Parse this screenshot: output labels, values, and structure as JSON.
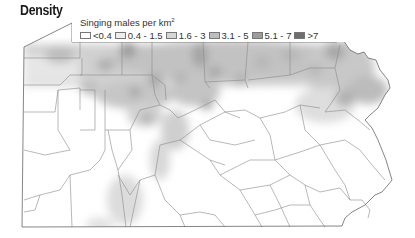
{
  "title": "Density",
  "legend": {
    "title": "Singing males per km",
    "title_superscript": "2",
    "classes": [
      {
        "label": "<0.4",
        "color": "#ffffff"
      },
      {
        "label": "0.4 - 1.5",
        "color": "#ededed"
      },
      {
        "label": "1.6 - 3",
        "color": "#d6d6d6"
      },
      {
        "label": "3.1 - 5",
        "color": "#bdbdbd"
      },
      {
        "label": "5.1 - 7",
        "color": "#9c9c9c"
      },
      {
        "label": ">7",
        "color": "#6e6e6e"
      }
    ]
  },
  "map": {
    "region": "Pennsylvania",
    "boundary_color": "#666666",
    "county_line_color": "#8a8a8a"
  }
}
